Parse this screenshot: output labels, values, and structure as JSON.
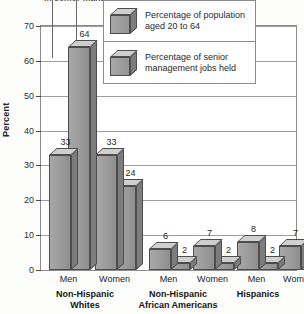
{
  "caption": {
    "text": "in senior management positions."
  },
  "chart_data": {
    "type": "bar",
    "title": "in senior management positions.",
    "xlabel": "",
    "ylabel": "Percent",
    "ylim": [
      0,
      70
    ],
    "yticks": [
      "0",
      "10",
      "20",
      "30",
      "40",
      "50",
      "60",
      "70"
    ],
    "grid": true,
    "legend_position": "top-right",
    "categories": [
      "Men",
      "Women",
      "Men",
      "Women",
      "Men",
      "Women"
    ],
    "groups": [
      {
        "label": "Non-Hispanic\nWhites",
        "line1": "Non-Hispanic",
        "line2": "Whites"
      },
      {
        "label": "Non-Hispanic\nAfrican Americans",
        "line1": "Non-Hispanic",
        "line2": "African Americans"
      },
      {
        "label": "Hispanics",
        "line1": "Hispanics",
        "line2": ""
      }
    ],
    "series": [
      {
        "name": "Percentage of population aged 20 to 64",
        "values": [
          33,
          33,
          6,
          7,
          8,
          7
        ]
      },
      {
        "name": "Percentage of senior management jobs held",
        "values": [
          64,
          24,
          2,
          2,
          2,
          1
        ]
      }
    ]
  },
  "legend": {
    "items": [
      {
        "label": "Percentage of population\naged 20 to 64",
        "swatch": "cube-3d-icon"
      },
      {
        "label": "Percentage of senior\nmanagement jobs held",
        "swatch": "cube-3d-icon"
      }
    ]
  }
}
